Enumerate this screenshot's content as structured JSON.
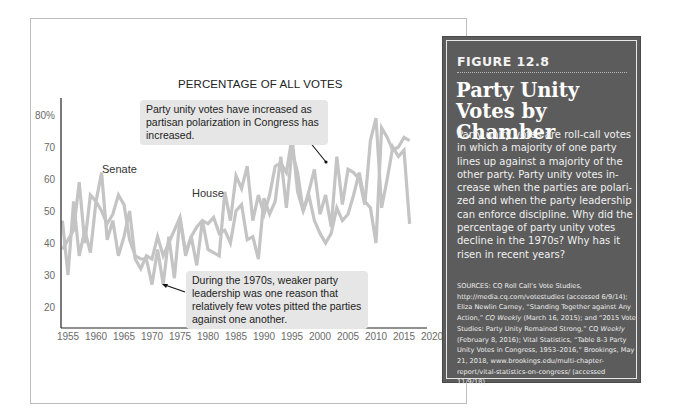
{
  "chart_data": {
    "type": "line",
    "title": "PERCENTAGE OF ALL VOTES",
    "xlabel": "",
    "ylabel": "Percentage of all votes",
    "ylim": [
      15,
      82
    ],
    "xlim": [
      1954,
      2020
    ],
    "y_ticks": [
      "80%",
      "70",
      "60",
      "50",
      "40",
      "30",
      "20"
    ],
    "y_tick_values": [
      80,
      70,
      60,
      50,
      40,
      30,
      20
    ],
    "x_ticks": [
      "1955",
      "1960",
      "1965",
      "1970",
      "1975",
      "1980",
      "1985",
      "1990",
      "1995",
      "2000",
      "2005",
      "2010",
      "2015",
      "2020"
    ],
    "grid": false,
    "legend": "inline labels",
    "series": [
      {
        "name": "Senate",
        "x": [
          1954,
          1955,
          1956,
          1957,
          1958,
          1959,
          1960,
          1961,
          1962,
          1963,
          1964,
          1965,
          1966,
          1967,
          1968,
          1969,
          1970,
          1971,
          1972,
          1973,
          1974,
          1975,
          1976,
          1977,
          1978,
          1979,
          1980,
          1981,
          1982,
          1983,
          1984,
          1985,
          1986,
          1987,
          1988,
          1989,
          1990,
          1991,
          1992,
          1993,
          1994,
          1995,
          1996,
          1997,
          1998,
          1999,
          2000,
          2001,
          2002,
          2003,
          2004,
          2005,
          2006,
          2007,
          2008,
          2009,
          2010,
          2011,
          2012,
          2013,
          2014,
          2015,
          2016
        ],
        "values": [
          47,
          30,
          53,
          36,
          44,
          37,
          53,
          62,
          41,
          47,
          36,
          42,
          50,
          35,
          32,
          36,
          35,
          42,
          36,
          40,
          44,
          48,
          37,
          42,
          45,
          47,
          46,
          48,
          43,
          44,
          40,
          50,
          52,
          41,
          42,
          35,
          54,
          49,
          53,
          67,
          51,
          69,
          62,
          50,
          56,
          63,
          49,
          55,
          45,
          67,
          52,
          63,
          62,
          60,
          52,
          72,
          79,
          51,
          60,
          70,
          67,
          69,
          46
        ]
      },
      {
        "name": "House",
        "x": [
          1954,
          1955,
          1956,
          1957,
          1958,
          1959,
          1960,
          1961,
          1962,
          1963,
          1964,
          1965,
          1966,
          1967,
          1968,
          1969,
          1970,
          1971,
          1972,
          1973,
          1974,
          1975,
          1976,
          1977,
          1978,
          1979,
          1980,
          1981,
          1982,
          1983,
          1984,
          1985,
          1986,
          1987,
          1988,
          1989,
          1990,
          1991,
          1992,
          1993,
          1994,
          1995,
          1996,
          1997,
          1998,
          1999,
          2000,
          2001,
          2002,
          2003,
          2004,
          2005,
          2006,
          2007,
          2008,
          2009,
          2010,
          2011,
          2012,
          2013,
          2014,
          2015,
          2016
        ],
        "values": [
          38,
          41,
          44,
          59,
          40,
          55,
          53,
          50,
          46,
          49,
          55,
          52,
          41,
          36,
          35,
          35,
          27,
          38,
          27,
          42,
          29,
          48,
          36,
          42,
          33,
          47,
          38,
          37,
          36,
          56,
          47,
          61,
          57,
          64,
          47,
          55,
          49,
          55,
          64,
          65,
          62,
          73,
          56,
          50,
          55,
          47,
          43,
          40,
          43,
          51,
          47,
          49,
          55,
          62,
          53,
          51,
          40,
          76,
          73,
          69,
          70,
          73,
          72
        ]
      }
    ],
    "annotations": [
      "Party unity votes have increased as partisan polarization in Congress has increased.",
      "During the 1970s, weaker party leadership was one reason that relatively few votes pitted the parties against one another."
    ]
  },
  "chart": {
    "title": "PERCENTAGE OF ALL VOTES",
    "labels": {
      "senate": "Senate",
      "house": "House"
    },
    "annotation_top": "Party unity votes have increased as partisan polarization in Congress has increased.",
    "annotation_bottom": "During the 1970s, weaker party leadership was one reason that relatively few votes pitted the parties against one another.",
    "line_color": "#c4c4c4",
    "axis_color": "#222222",
    "note_bg": "#e6e6e6"
  },
  "panel": {
    "figure_label": "FIGURE 12.8",
    "title": "Party Unity Votes by Chamber",
    "description": "Party unity votes are roll-call votes in which a majority of one party lines up against a majority of the other party. Party unity votes in­crease when the parties are polari­zed and when the party leadership can enforce discipline. Why did the percentage of party unity votes decline in the 1970s? Why has it risen in recent years?",
    "sources_prefix": "SOURCES: CQ Roll Call’s Vote Studies, http://media.cq.com/votestudies (accessed 6/9/14); Eliza Newlin Carney, “Standing Together against Any Action,” ",
    "sources_em1": "CQ Weekly",
    "sources_mid1": " (March 16, 2015); and “2015 Vote Studies: Party Unity Remained Strong,” CQ ",
    "sources_em2": "Weekly",
    "sources_suffix": " (February 8, 2016); Vital Statistics, “Table 8-3 Party Unity Votes in Congress, 1953–2016,” Brookings, May 21, 2018, www.brookings.edu/multi-chapter-report/vital-statistics-on-congress/ (accessed 11/9/18).",
    "background": "#5c5c5c"
  }
}
